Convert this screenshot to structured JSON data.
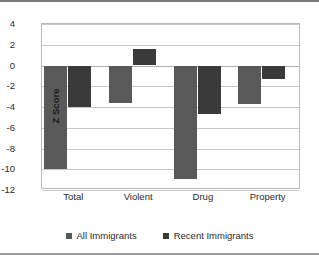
{
  "chart_data": {
    "type": "bar",
    "title": "",
    "xlabel": "",
    "ylabel": "Z Score",
    "categories": [
      "Total",
      "Violent",
      "Drug",
      "Property"
    ],
    "series": [
      {
        "name": "All Immigrants",
        "color": "#595959",
        "values": [
          -10.0,
          -3.6,
          -10.9,
          -3.7
        ]
      },
      {
        "name": "Recent Immigrants",
        "color": "#3a3a3a",
        "values": [
          -4.0,
          1.55,
          -4.7,
          -1.3
        ]
      }
    ],
    "ylim": [
      -12,
      4
    ],
    "yticks": [
      4,
      2,
      0,
      -2,
      -4,
      -6,
      -8,
      -10,
      -12
    ],
    "ytick_labels": [
      "4",
      "2",
      "0",
      "-2",
      "-4",
      "-6",
      "-8",
      "-10",
      "-12"
    ],
    "grid": true,
    "legend_position": "bottom",
    "legend": [
      "All Immigrants",
      "Recent Immigrants"
    ]
  }
}
